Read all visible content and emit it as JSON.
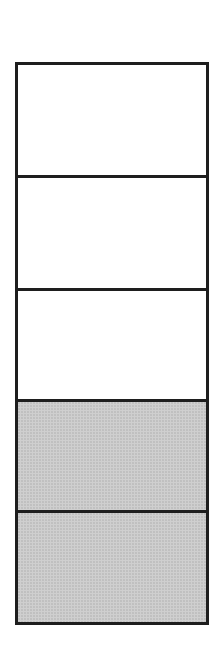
{
  "diagram": {
    "type": "stacked-cells",
    "total_cells": 5,
    "filled_cells": 2,
    "colors": {
      "border": "#1e1e1e",
      "empty": "#ffffff",
      "filled": "#cfcfcf"
    },
    "cells": [
      {
        "index": 0,
        "state": "empty",
        "height": 110
      },
      {
        "index": 1,
        "state": "empty",
        "height": 113
      },
      {
        "index": 2,
        "state": "empty",
        "height": 111
      },
      {
        "index": 3,
        "state": "filled",
        "height": 111
      },
      {
        "index": 4,
        "state": "filled",
        "height": 112
      }
    ]
  }
}
